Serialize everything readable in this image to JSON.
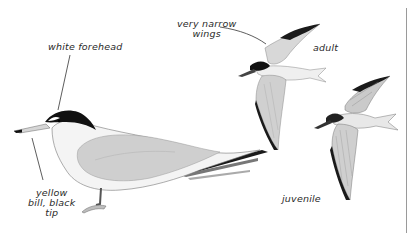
{
  "plate": {
    "subject": "tern",
    "labels": {
      "white_forehead": "white forehead",
      "very_narrow_wings": "very narrow\nwings",
      "adult": "adult",
      "yellow_bill": "yellow\nbill, black\ntip",
      "juvenile": "juvenile"
    },
    "figures": [
      {
        "name": "standing-adult",
        "pose": "standing"
      },
      {
        "name": "flying-adult",
        "pose": "flying"
      },
      {
        "name": "flying-juvenile",
        "pose": "flying"
      }
    ],
    "colors": {
      "background": "#ffffff",
      "cap": "#111111",
      "mantle_grey": "#cfcfcf",
      "wingtip_black": "#1a1a1a",
      "underparts": "#f4f4f4",
      "ink": "#2a2a2a"
    }
  }
}
